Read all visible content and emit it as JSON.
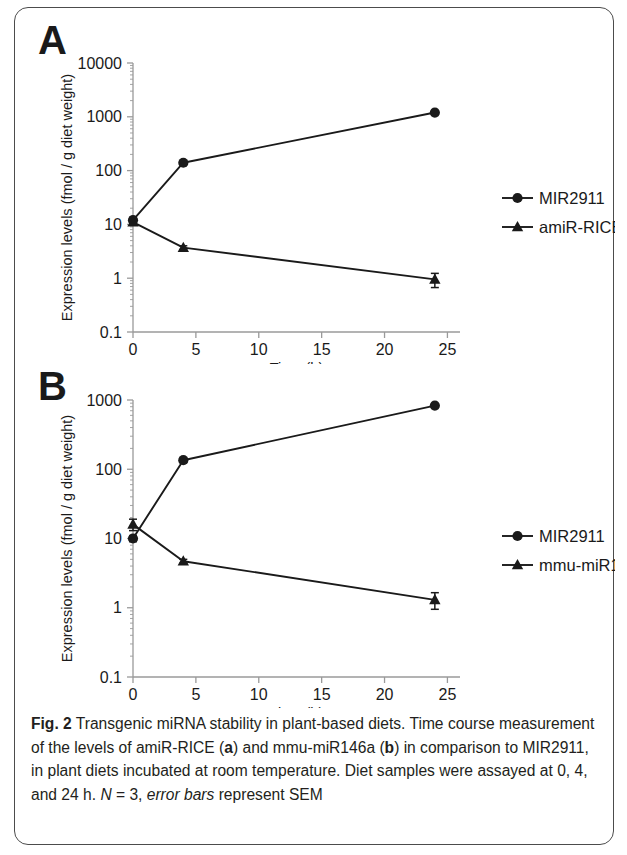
{
  "figure": {
    "panel_a_letter": "A",
    "panel_b_letter": "B"
  },
  "caption": {
    "fig_number": "Fig. 2",
    "text_1": " Transgenic miRNA stability in plant-based diets. Time course measurement of the levels of amiR-RICE (",
    "bold_a": "a",
    "text_2": ") and mmu-miR146a (",
    "bold_b": "b",
    "text_3": ") in comparison to MIR2911, in plant diets incubated at room temperature. Diet samples were assayed at 0, 4, and 24 h. ",
    "italic_n": "N",
    "text_4": " = 3, ",
    "italic_errorbars": "error bars",
    "text_5": " represent SEM"
  },
  "chart_data": [
    {
      "panel": "A",
      "type": "line",
      "title": "",
      "xlabel": "Time (h)",
      "ylabel": "Expression levels (fmol / g diet weight)",
      "yscale": "log",
      "ylim": [
        0.1,
        10000
      ],
      "xlim": [
        0,
        26
      ],
      "ytick_labels": [
        "10000",
        "1000",
        "100",
        "10",
        "1",
        "0.1"
      ],
      "ytick_values": [
        10000,
        1000,
        100,
        10,
        1,
        0.1
      ],
      "xtick_labels": [
        "0",
        "5",
        "10",
        "15",
        "20",
        "25"
      ],
      "xtick_values": [
        0,
        5,
        10,
        15,
        20,
        25
      ],
      "grid": false,
      "legend_position": "right",
      "x": [
        0,
        4,
        24
      ],
      "series": [
        {
          "name": "MIR2911",
          "marker": "circle",
          "values": [
            12,
            140,
            1200
          ],
          "errors": [
            1.5,
            12,
            0
          ]
        },
        {
          "name": "amiR-RICE",
          "marker": "triangle",
          "values": [
            11,
            3.7,
            0.95
          ],
          "errors": [
            1.2,
            0.3,
            0.28
          ]
        }
      ]
    },
    {
      "panel": "B",
      "type": "line",
      "title": "",
      "xlabel": "Time (h)",
      "ylabel": "Expression levels (fmol / g diet weight)",
      "yscale": "log",
      "ylim": [
        0.1,
        1000
      ],
      "xlim": [
        0,
        26
      ],
      "ytick_labels": [
        "1000",
        "100",
        "10",
        "1",
        "0.1"
      ],
      "ytick_values": [
        1000,
        100,
        10,
        1,
        0.1
      ],
      "xtick_labels": [
        "0",
        "5",
        "10",
        "15",
        "20",
        "25"
      ],
      "xtick_values": [
        0,
        5,
        10,
        15,
        20,
        25
      ],
      "grid": false,
      "legend_position": "right",
      "x": [
        0,
        4,
        24
      ],
      "series": [
        {
          "name": "MIR2911",
          "marker": "circle",
          "values": [
            10,
            135,
            830
          ],
          "errors": [
            1.0,
            10,
            0
          ]
        },
        {
          "name": "mmu-miR146a",
          "marker": "triangle",
          "values": [
            16,
            4.7,
            1.3
          ],
          "errors": [
            3.0,
            0.3,
            0.35
          ]
        }
      ]
    }
  ],
  "colors": {
    "ink": "#1a1a1a",
    "axis": "#9a9a9a",
    "frame": "#4c4c4c"
  }
}
